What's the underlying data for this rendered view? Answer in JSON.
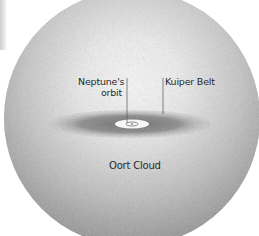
{
  "diagram": {
    "labels": {
      "neptune_orbit_line1": "Neptune's",
      "neptune_orbit_line2": "orbit",
      "kuiper_belt": "Kuiper Belt",
      "oort_cloud": "Oort Cloud"
    },
    "colors": {
      "background": "#ffffff",
      "cloud_edge": "#8f8f8f",
      "cloud_center": "#f4f4f4",
      "belt": "#7a7a7a",
      "orbit_core": "#ffffff",
      "text": "#2a2a2a",
      "leader_line": "#555555"
    },
    "shapes": {
      "sphere": {
        "cx": 132,
        "cy": 118,
        "r": 128
      },
      "belt": {
        "cx": 130,
        "cy": 124,
        "rx": 82,
        "ry": 14
      },
      "orbit_core": {
        "cx": 132,
        "cy": 124,
        "rx": 16,
        "ry": 4
      }
    }
  }
}
